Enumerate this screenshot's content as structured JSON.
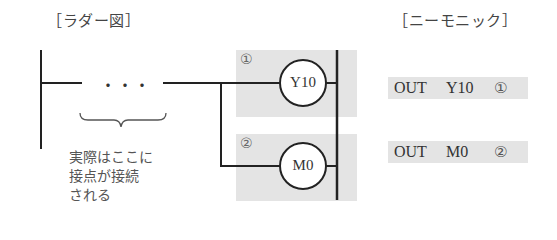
{
  "headings": {
    "ladder": "［ラダー図］",
    "mnemonic": "［ニーモニック］"
  },
  "ladder": {
    "contact_placeholder": "・・・",
    "note_lines": [
      "実際はここに",
      "接点が接続",
      "される"
    ],
    "rungs": [
      {
        "marker": "①",
        "coil": "Y10"
      },
      {
        "marker": "②",
        "coil": "M0"
      }
    ]
  },
  "mnemonic": {
    "lines": [
      {
        "instruction": "OUT",
        "device": "Y10",
        "marker": "①"
      },
      {
        "instruction": "OUT",
        "device": "M0",
        "marker": "②"
      }
    ]
  },
  "colors": {
    "line": "#222222",
    "highlight": "#e4e4e4",
    "text": "#333333"
  }
}
